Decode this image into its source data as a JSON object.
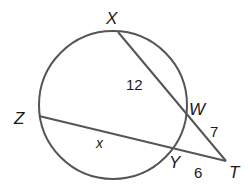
{
  "diagram": {
    "type": "circle-secants",
    "points": {
      "X": "X",
      "W": "W",
      "Z": "Z",
      "Y": "Y",
      "T": "T"
    },
    "segments": {
      "XW": "12",
      "WT": "7",
      "ZY": "x",
      "YT": "6"
    },
    "colors": {
      "stroke": "#555555",
      "text": "#1a1a1a",
      "background": "#ffffff"
    }
  }
}
